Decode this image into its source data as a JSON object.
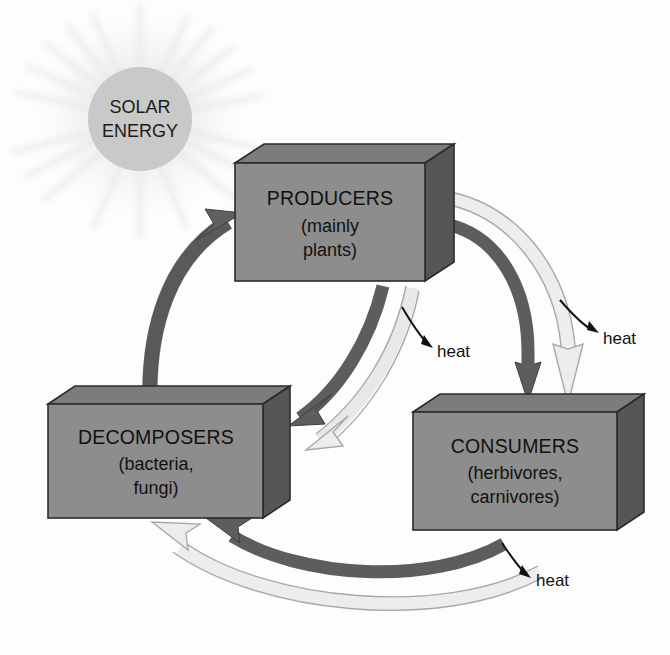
{
  "diagram": {
    "background_color": "#fdfdfd"
  },
  "sun": {
    "label_line1": "SOLAR",
    "label_line2": "ENERGY",
    "fill_color": "#c9c9c9",
    "ray_color": "#ededed",
    "center_x": 140,
    "center_y": 119,
    "radius": 52
  },
  "boxes": [
    {
      "id": "producers",
      "title": "PRODUCERS",
      "sub_line1": "(mainly",
      "sub_line2": "plants)",
      "face_color": "#8d8d8d",
      "side_color": "#5f5f5f",
      "top_color": "#7a7a7a",
      "x": 235,
      "y": 163,
      "width": 190,
      "height": 118,
      "depth": 29
    },
    {
      "id": "decomposers",
      "title": "DECOMPOSERS",
      "sub_line1": "(bacteria,",
      "sub_line2": "fungi)",
      "face_color": "#8d8d8d",
      "side_color": "#5f5f5f",
      "top_color": "#7a7a7a",
      "x": 48,
      "y": 404,
      "width": 215,
      "height": 114,
      "depth": 27
    },
    {
      "id": "consumers",
      "title": "CONSUMERS",
      "sub_line1": "(herbivores,",
      "sub_line2": "carnivores)",
      "face_color": "#8d8d8d",
      "side_color": "#5f5f5f",
      "top_color": "#7a7a7a",
      "x": 413,
      "y": 412,
      "width": 204,
      "height": 118,
      "depth": 27
    }
  ],
  "heat_labels": [
    {
      "id": "heat-producers-decomposers",
      "text": "heat",
      "x": 437,
      "y": 351
    },
    {
      "id": "heat-producers-consumers",
      "text": "heat",
      "x": 603,
      "y": 338
    },
    {
      "id": "heat-consumers-decomposers",
      "text": "heat",
      "x": 536,
      "y": 580
    }
  ],
  "flows": [
    {
      "id": "producers-to-consumers-energy",
      "from": "producers",
      "to": "consumers",
      "style": "dark",
      "color": "#5d5d5d",
      "meaning": "energy / biomass transfer"
    },
    {
      "id": "producers-to-consumers-loss",
      "from": "producers",
      "to": "consumers",
      "style": "light",
      "color": "#e2e2e2",
      "meaning": "energy loss to heat"
    },
    {
      "id": "producers-to-decomposers-energy",
      "from": "producers",
      "to": "decomposers",
      "style": "dark",
      "color": "#5d5d5d",
      "meaning": "dead organic matter"
    },
    {
      "id": "producers-to-decomposers-loss",
      "from": "producers",
      "to": "decomposers",
      "style": "light",
      "color": "#e2e2e2",
      "meaning": "energy loss to heat"
    },
    {
      "id": "consumers-to-decomposers-energy",
      "from": "consumers",
      "to": "decomposers",
      "style": "dark",
      "color": "#5d5d5d",
      "meaning": "dead organic matter"
    },
    {
      "id": "consumers-to-decomposers-loss",
      "from": "consumers",
      "to": "decomposers",
      "style": "light",
      "color": "#e2e2e2",
      "meaning": "energy loss to heat"
    },
    {
      "id": "decomposers-to-producers",
      "from": "decomposers",
      "to": "producers",
      "style": "dark",
      "color": "#5d5d5d",
      "meaning": "nutrient recycling"
    }
  ]
}
